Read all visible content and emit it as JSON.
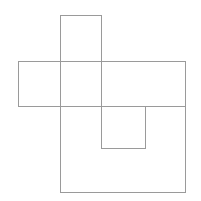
{
  "canvas": {
    "width": 201,
    "height": 201,
    "background_color": "#ffffff",
    "title": "Overlapping rectangles line figure"
  },
  "style": {
    "stroke_color": "#9a9a9a",
    "stroke_width": 1,
    "fill": "none"
  },
  "figure": {
    "shape_count": 4,
    "shapes": [
      {
        "id": "tall-rectangle",
        "label": "Tall vertical rectangle",
        "kind": "rectangle",
        "x": 60,
        "y": 15,
        "width": 41,
        "height": 91,
        "stroke_color": "#9a9a9a"
      },
      {
        "id": "wide-rectangle",
        "label": "Wide horizontal rectangle",
        "kind": "rectangle",
        "x": 18,
        "y": 61,
        "width": 167,
        "height": 45,
        "stroke_color": "#9a9a9a"
      },
      {
        "id": "large-rectangle",
        "label": "Large rectangle",
        "kind": "rectangle",
        "x": 60,
        "y": 61,
        "width": 125,
        "height": 131,
        "stroke_color": "#9a9a9a"
      },
      {
        "id": "small-square",
        "label": "Small square",
        "kind": "rectangle",
        "x": 101,
        "y": 106,
        "width": 44,
        "height": 42,
        "stroke_color": "#9a9a9a"
      }
    ]
  }
}
